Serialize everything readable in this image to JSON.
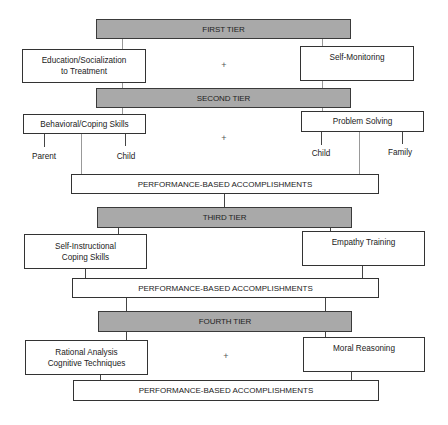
{
  "diagram": {
    "tiers": [
      {
        "label": "FIRST TIER"
      },
      {
        "label": "SECOND TIER"
      },
      {
        "label": "THIRD TIER"
      },
      {
        "label": "FOURTH TIER"
      }
    ],
    "first_tier": {
      "left": "Education/Socialization to Treatment",
      "left_line1": "Education/Socialization",
      "left_line2": "to Treatment",
      "connector": "+",
      "right": "Self-Monitoring"
    },
    "second_tier": {
      "left": "Behavioral/Coping Skills",
      "left_children": [
        "Parent",
        "Child"
      ],
      "connector": "+",
      "right": "Problem Solving",
      "right_children": [
        "Child",
        "Family"
      ],
      "outcome": "PERFORMANCE-BASED ACCOMPLISHMENTS"
    },
    "third_tier": {
      "left": "Self-Instructional Coping Skills",
      "left_line1": "Self-Instructional",
      "left_line2": "Coping Skills",
      "right": "Empathy Training",
      "outcome": "PERFORMANCE-BASED ACCOMPLISHMENTS"
    },
    "fourth_tier": {
      "left": "Rational Analysis Cognitive Techniques",
      "left_line1": "Rational Analysis",
      "left_line2": "Cognitive Techniques",
      "connector": "+",
      "right": "Moral Reasoning",
      "outcome": "PERFORMANCE-BASED ACCOMPLISHMENTS"
    },
    "colors": {
      "tier_fill": "#a9a9a9",
      "border": "#333333",
      "background": "#ffffff"
    }
  }
}
